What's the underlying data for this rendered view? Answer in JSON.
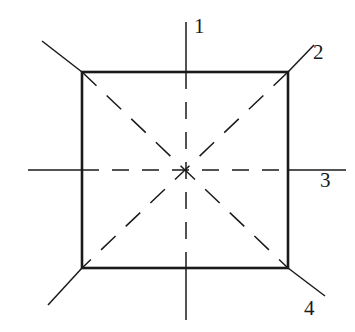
{
  "figure": {
    "width": 355,
    "height": 332,
    "background_color": "#ffffff",
    "stroke_color": "#1a1a1a"
  },
  "shape": {
    "name": "square",
    "stroke_color": "#1a1a1a",
    "stroke_width": 2.6,
    "fill": "none",
    "corners": {
      "top_left": [
        82,
        72
      ],
      "top_right": [
        288,
        72
      ],
      "bottom_right": [
        288,
        268
      ],
      "bottom_left": [
        82,
        268
      ]
    }
  },
  "center": {
    "x": 186,
    "y": 170,
    "label": ""
  },
  "axes": [
    {
      "id": "axis-1",
      "label": "1",
      "orientation": "vertical",
      "stroke_color": "#1a1a1a",
      "stroke_width": 1.5,
      "outer_segments": [
        [
          186,
          22,
          186,
          72
        ],
        [
          186,
          268,
          186,
          320
        ]
      ],
      "inner_dashed": [
        186,
        72,
        186,
        268
      ],
      "dash_pattern": "17 13",
      "label_x": 194,
      "label_y": 16
    },
    {
      "id": "axis-2",
      "label": "2",
      "orientation": "diagonal-ne-sw",
      "stroke_color": "#1a1a1a",
      "stroke_width": 1.5,
      "outer_segments": [
        [
          288,
          72,
          314,
          45
        ],
        [
          82,
          268,
          48,
          305
        ]
      ],
      "inner_dashed": [
        288,
        72,
        82,
        268
      ],
      "dash_pattern": "20 14",
      "label_x": 313,
      "label_y": 42
    },
    {
      "id": "axis-3",
      "label": "3",
      "orientation": "horizontal",
      "stroke_color": "#1a1a1a",
      "stroke_width": 1.5,
      "outer_segments": [
        [
          28,
          170,
          82,
          170
        ],
        [
          288,
          170,
          346,
          170
        ]
      ],
      "inner_dashed": [
        82,
        170,
        288,
        170
      ],
      "dash_pattern": "17 13",
      "label_x": 320,
      "label_y": 170
    },
    {
      "id": "axis-4",
      "label": "4",
      "orientation": "diagonal-nw-se",
      "stroke_color": "#1a1a1a",
      "stroke_width": 1.5,
      "outer_segments": [
        [
          82,
          72,
          42,
          41
        ],
        [
          288,
          268,
          325,
          296
        ]
      ],
      "inner_dashed": [
        82,
        72,
        288,
        268
      ],
      "dash_pattern": "20 14",
      "label_x": 304,
      "label_y": 298
    }
  ]
}
